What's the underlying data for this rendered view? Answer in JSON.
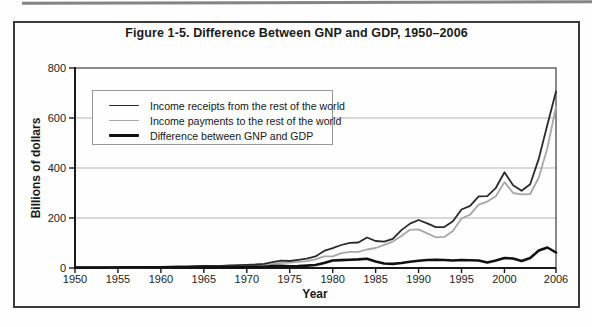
{
  "figure": {
    "title": "Figure 1-5. Difference Between GNP and GDP, 1950–2006"
  },
  "axes": {
    "y_label": "Billions of dollars",
    "x_label": "Year",
    "y_ticks": [
      "0",
      "200",
      "400",
      "600",
      "800"
    ],
    "x_ticks": [
      "1950",
      "1955",
      "1960",
      "1965",
      "1970",
      "1975",
      "1980",
      "1985",
      "1990",
      "1995",
      "2000",
      "2006"
    ]
  },
  "legend": {
    "items": [
      {
        "label": "Income receipts from the rest of the world"
      },
      {
        "label": "Income payments to the rest of the world"
      },
      {
        "label": "Difference between GNP and GDP"
      }
    ]
  },
  "colors": {
    "axis": "#1a1a1a",
    "frame": "#3c3c3c",
    "gridline": "#b3b3b3",
    "figure_border": "#3a3a3a"
  },
  "chart_data": {
    "type": "line",
    "title": "Figure 1-5. Difference Between GNP and GDP, 1950–2006",
    "xlabel": "Year",
    "ylabel": "Billions of dollars",
    "xlim": [
      1950,
      2006
    ],
    "ylim": [
      0,
      800
    ],
    "gridlines": [
      200,
      400,
      600
    ],
    "grid": "horizontal",
    "legend_position": "upper-left-inside",
    "x": [
      1950,
      1951,
      1952,
      1953,
      1954,
      1955,
      1956,
      1957,
      1958,
      1959,
      1960,
      1961,
      1962,
      1963,
      1964,
      1965,
      1966,
      1967,
      1968,
      1969,
      1970,
      1971,
      1972,
      1973,
      1974,
      1975,
      1976,
      1977,
      1978,
      1979,
      1980,
      1981,
      1982,
      1983,
      1984,
      1985,
      1986,
      1987,
      1988,
      1989,
      1990,
      1991,
      1992,
      1993,
      1994,
      1995,
      1996,
      1997,
      1998,
      1999,
      2000,
      2001,
      2002,
      2003,
      2004,
      2005,
      2006
    ],
    "series": [
      {
        "key": "receipts",
        "name": "Income receipts from the rest of the world",
        "color": "#2a2a2a",
        "stroke_width": 1.8,
        "values": [
          2.2,
          2.8,
          2.9,
          2.9,
          3.0,
          3.5,
          3.9,
          4.3,
          4.2,
          4.6,
          4.9,
          5.3,
          5.9,
          6.5,
          7.2,
          7.9,
          8.1,
          8.8,
          10.1,
          11.8,
          12.8,
          14.0,
          16.3,
          23.5,
          29.8,
          28.0,
          32.4,
          37.2,
          46.3,
          68.3,
          79.1,
          92.0,
          101.0,
          101.9,
          121.9,
          108.1,
          105.3,
          116.5,
          151.8,
          177.7,
          191.9,
          178.3,
          163.6,
          163.8,
          186.6,
          233.9,
          248.7,
          286.7,
          287.1,
          320.8,
          382.7,
          331.2,
          309.0,
          335.2,
          437.5,
          573.3,
          706.0
        ]
      },
      {
        "key": "payments",
        "name": "Income payments to the rest of the world",
        "color": "#a7a7a7",
        "stroke_width": 1.8,
        "values": [
          0.7,
          0.9,
          1.0,
          1.1,
          1.2,
          1.4,
          1.6,
          1.8,
          2.0,
          2.4,
          2.6,
          2.8,
          3.1,
          3.5,
          3.8,
          4.3,
          4.9,
          5.7,
          7.0,
          8.7,
          9.3,
          9.8,
          11.5,
          15.5,
          20.9,
          21.7,
          24.7,
          27.6,
          34.4,
          47.0,
          46.5,
          59.1,
          64.5,
          64.8,
          74.0,
          80.0,
          93.0,
          105.5,
          128.5,
          152.9,
          154.3,
          138.5,
          123.0,
          124.3,
          148.1,
          198.1,
          213.7,
          253.7,
          265.8,
          287.0,
          343.7,
          300.0,
          295.0,
          296.0,
          361.9,
          480.0,
          645.0
        ]
      },
      {
        "key": "difference",
        "name": "Difference between GNP and GDP",
        "color": "#111111",
        "stroke_width": 2.6,
        "values": [
          1.5,
          1.7,
          1.8,
          1.8,
          1.9,
          2.1,
          2.3,
          2.5,
          2.2,
          2.2,
          2.3,
          2.5,
          2.8,
          3.0,
          3.4,
          3.6,
          3.2,
          3.1,
          3.1,
          3.1,
          3.5,
          4.2,
          4.8,
          8.0,
          8.9,
          6.3,
          7.7,
          9.6,
          11.9,
          20.0,
          30.0,
          31.5,
          33.0,
          34.5,
          37.0,
          26.0,
          18.0,
          16.5,
          20.0,
          25.0,
          29.0,
          32.0,
          33.0,
          32.0,
          30.0,
          32.0,
          31.0,
          30.0,
          22.0,
          30.0,
          40.0,
          38.0,
          28.0,
          40.0,
          70.0,
          82.0,
          62.0
        ]
      }
    ]
  }
}
